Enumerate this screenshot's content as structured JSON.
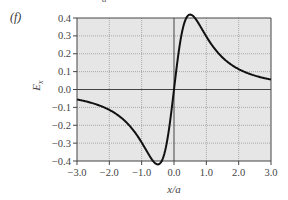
{
  "panel_label": "(f)",
  "top_fragment": "a",
  "chart_data": {
    "type": "line",
    "title": "",
    "xlabel": "x/a",
    "ylabel": "E_x",
    "xlim": [
      -3.0,
      3.0
    ],
    "ylim": [
      -0.4,
      0.4
    ],
    "xticks": [
      "-3.0",
      "-2.0",
      "-1.0",
      "0.0",
      "1.0",
      "2.0",
      "3.0"
    ],
    "yticks": [
      "0.4",
      "0.3",
      "0.2",
      "0.1",
      "0.0",
      "-0.1",
      "-0.2",
      "-0.3",
      "-0.4"
    ],
    "grid": true,
    "legend": null,
    "series": [
      {
        "name": "E_x",
        "x": [
          -3.0,
          -2.5,
          -2.0,
          -1.5,
          -1.2,
          -1.0,
          -0.8,
          -0.707,
          -0.6,
          -0.4,
          -0.2,
          0.0,
          0.2,
          0.4,
          0.6,
          0.707,
          0.8,
          1.0,
          1.2,
          1.5,
          2.0,
          2.5,
          3.0
        ],
        "y": [
          -0.095,
          -0.128,
          -0.179,
          -0.263,
          -0.328,
          -0.354,
          -0.378,
          -0.385,
          -0.378,
          -0.299,
          -0.16,
          0.0,
          0.16,
          0.299,
          0.378,
          0.385,
          0.378,
          0.354,
          0.328,
          0.263,
          0.179,
          0.128,
          0.095
        ]
      }
    ]
  }
}
